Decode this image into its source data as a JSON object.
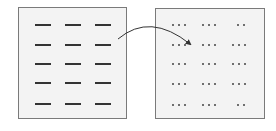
{
  "diagram": {
    "colors": {
      "panel_fill": "#f3f3f3",
      "panel_border": "#7a7a7a",
      "dash": "#333333",
      "dot": "#555555",
      "arrow": "#333333"
    },
    "left_panel": {
      "rows": 5,
      "columns": 3,
      "element": "dash",
      "row_y": [
        16,
        36,
        55,
        74,
        95
      ],
      "col_x": [
        16,
        46,
        76
      ]
    },
    "right_panel": {
      "rows": 5,
      "columns": 3,
      "element": "dot-group",
      "row_y": [
        15,
        35,
        54,
        74,
        95
      ],
      "col_x": [
        16,
        46,
        76
      ],
      "dot_counts": [
        [
          3,
          3,
          2
        ],
        [
          3,
          3,
          3
        ],
        [
          3,
          3,
          3
        ],
        [
          3,
          3,
          3
        ],
        [
          3,
          3,
          2
        ]
      ]
    },
    "arrow": {
      "from": "left-panel",
      "to": "right-panel",
      "shape": "curved"
    }
  }
}
